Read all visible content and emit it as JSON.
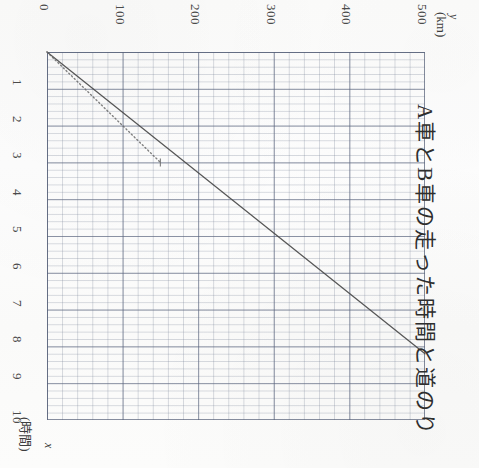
{
  "title": "A車とB車の走った時間と道のり",
  "axes": {
    "y_label_symbol": "y",
    "y_label_unit": "(km)",
    "x_label_symbol": "x",
    "x_label_unit": "(時間)",
    "y_ticks": [
      "0",
      "100",
      "200",
      "300",
      "400",
      "500"
    ],
    "x_ticks": [
      "1",
      "2",
      "3",
      "4",
      "5",
      "6",
      "7",
      "8",
      "9",
      "10"
    ]
  },
  "chart_data": {
    "type": "line",
    "title": "A車とB車の走った時間と道のり",
    "xlabel": "x (時間)",
    "ylabel": "y (km)",
    "xlim": [
      0,
      10
    ],
    "ylim": [
      0,
      500
    ],
    "grid": true,
    "legend": "none",
    "series": [
      {
        "name": "A車",
        "style": "solid",
        "color": "#4a4a4a",
        "x": [
          0,
          8.2
        ],
        "y": [
          0,
          500
        ],
        "slope_km_per_hour": 61
      },
      {
        "name": "B車",
        "style": "dotted",
        "color": "#6b6b6b",
        "x": [
          0,
          3
        ],
        "y": [
          0,
          150
        ],
        "slope_km_per_hour": 50
      }
    ]
  },
  "colors": {
    "paper": "#fdfdfc",
    "grid_minor": "#7882961f",
    "grid_major": "#5a647d9e",
    "ink": "#4a4a4a"
  }
}
